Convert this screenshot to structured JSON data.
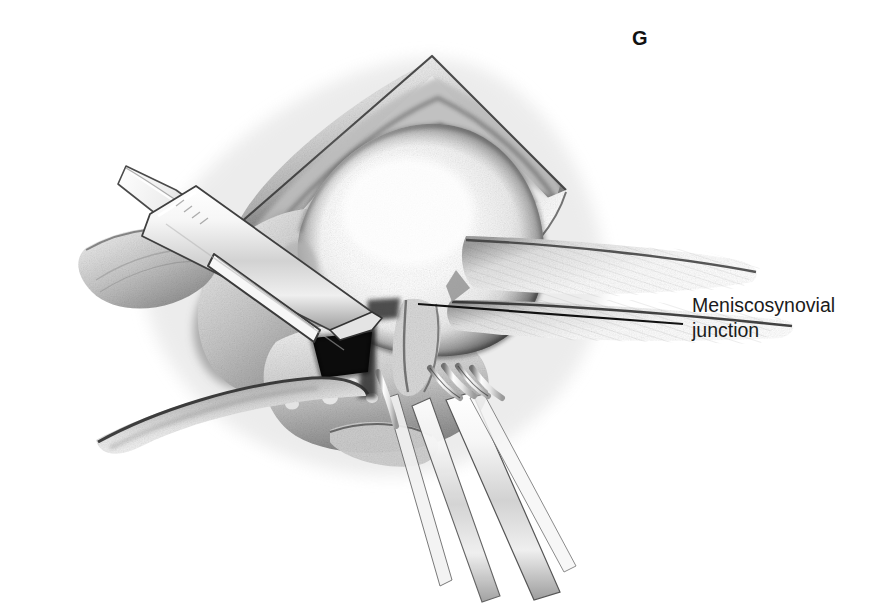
{
  "figure": {
    "kind": "medical-surgical-illustration",
    "background_color": "#ffffff",
    "ink_color": "#1b1b1b",
    "width": 872,
    "height": 608
  },
  "panel": {
    "label": "G",
    "x": 632,
    "y": 38
  },
  "callout": {
    "label_line1": "Meniscosynovial",
    "label_line2": "junction",
    "text_x": 692,
    "text_y": 294,
    "leader_line": {
      "x1": 418,
      "y1": 304,
      "x2": 683,
      "y2": 324,
      "stroke": "#111111",
      "width": 2.2
    }
  },
  "anatomy": [
    {
      "name": "femoral-condyle",
      "description": "Large bright rounded articular surface of the femoral condyle filling the centre of the wound",
      "tone": "highlight"
    },
    {
      "name": "wound-margin-superior",
      "description": "Triangular apex of the retracted capsular incision at the top of the field",
      "tone": "mid"
    },
    {
      "name": "synovial-fold",
      "description": "Shaded synovial tissue bordering the condyle",
      "tone": "mid-dark"
    },
    {
      "name": "meniscus",
      "description": "Wedge of meniscus at the joint line below the condyle",
      "tone": "mid"
    },
    {
      "name": "joint-space-void",
      "description": "Black wedge-shaped opening of the joint space beneath the blade tip",
      "tone": "black"
    },
    {
      "name": "retracted-tissue-flap-right",
      "description": "Capsular flap swept to the right with fine hatched shading",
      "tone": "light"
    },
    {
      "name": "skin-edge-lower-left",
      "description": "Sweeping skin and subcutaneous edge curving to the lower left",
      "tone": "mid"
    }
  ],
  "instruments": [
    {
      "name": "scalpel",
      "description": "Scalpel with slotted handle entering from upper left, blade tip at the joint line",
      "tip_x": 372,
      "tip_y": 320
    },
    {
      "name": "retractor-upper-left",
      "description": "Flat retractor blade crossing the scalpel at the upper left wound margin"
    },
    {
      "name": "rake-retractor-lower-right",
      "description": "Multi-pronged rake retractor with four tines holding tissue at the lower right",
      "prongs": 4
    }
  ]
}
